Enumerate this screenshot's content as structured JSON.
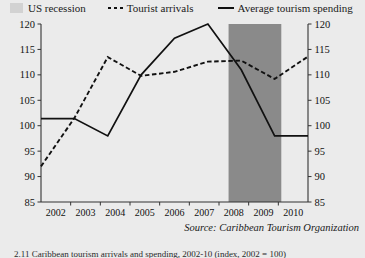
{
  "legend": {
    "recession": {
      "label": "US recession",
      "swatch": "gray-box-swatch",
      "color": "#d2d2d2"
    },
    "arrivals": {
      "label": "Tourist arrivals",
      "swatch": "dashed-line-swatch",
      "color": "#111111"
    },
    "spending": {
      "label": "Average tourism spending",
      "swatch": "solid-line-swatch",
      "color": "#111111"
    }
  },
  "source": {
    "text": "Source: Caribbean Tourism Organization"
  },
  "caption": {
    "text": "2.11 Caribbean tourism arrivals and spending, 2002-10 (index, 2002 = 100)"
  },
  "chart_data": {
    "type": "line",
    "title": "",
    "xlabel": "",
    "ylabel": "",
    "x": [
      2002,
      2003,
      2004,
      2005,
      2006,
      2007,
      2008,
      2009,
      2010
    ],
    "categories": [
      "2002",
      "2003",
      "2004",
      "2005",
      "2006",
      "2007",
      "2008",
      "2009",
      "2010"
    ],
    "ylim": [
      85,
      120
    ],
    "yticks": [
      85,
      90,
      95,
      100,
      105,
      110,
      115,
      120
    ],
    "y2lim": [
      85,
      120
    ],
    "y2ticks": [
      85,
      90,
      95,
      100,
      105,
      110,
      115,
      120
    ],
    "xlim": [
      2002,
      2010
    ],
    "grid": false,
    "legend_position": "top",
    "dual_axis": true,
    "series": [
      {
        "name": "Tourist arrivals",
        "style": "dashed",
        "color": "#111111",
        "values": [
          92.0,
          101.5,
          113.5,
          109.8,
          110.6,
          112.6,
          112.8,
          109.2,
          113.6
        ]
      },
      {
        "name": "Average tourism spending",
        "style": "solid",
        "color": "#111111",
        "values": [
          101.4,
          101.4,
          98.0,
          110.0,
          117.2,
          120.0,
          111.0,
          98.0,
          98.0
        ]
      }
    ],
    "bands": [
      {
        "name": "US recession",
        "color": "#8a8a8a",
        "x_start": 2007.62,
        "x_end": 2009.2
      }
    ]
  }
}
